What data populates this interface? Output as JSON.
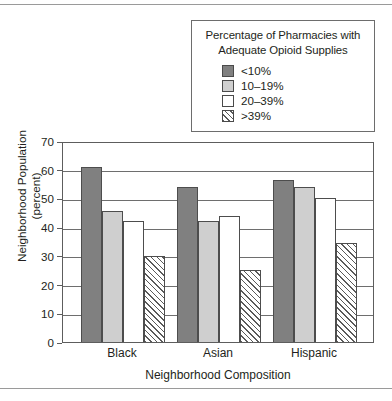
{
  "chart_data": {
    "type": "bar",
    "title": "",
    "xlabel": "Neighborhood Composition",
    "ylabel": "Neighborhood Population (percent)",
    "ylabel_line1": "Neighborhood Population",
    "ylabel_line2": "(percent)",
    "legend_title_line1": "Percentage of Pharmacies with",
    "legend_title_line2": "Adequate Opioid Supplies",
    "legend_position": "top-right",
    "grid": true,
    "ylim": [
      0,
      70
    ],
    "yticks": [
      "0",
      "10",
      "20",
      "30",
      "40",
      "50",
      "60",
      "70"
    ],
    "categories": [
      "Black",
      "Asian",
      "Hispanic"
    ],
    "series": [
      {
        "name": "<10%",
        "fill": "dark",
        "values": [
          61,
          54,
          56.5
        ]
      },
      {
        "name": "10–19%",
        "fill": "light",
        "values": [
          45.5,
          42,
          54
        ]
      },
      {
        "name": "20–39%",
        "fill": "white",
        "values": [
          42,
          44,
          50
        ]
      },
      {
        "name": ">39%",
        "fill": "hatch",
        "values": [
          30,
          25,
          34.5
        ]
      }
    ]
  },
  "colors": {
    "dark": "#808080",
    "light": "#cfcfcf",
    "white": "#ffffff",
    "hatch_line": "#5a5a5a",
    "axis": "#5d5d5d",
    "text": "#231f20"
  }
}
